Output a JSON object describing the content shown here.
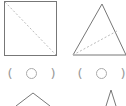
{
  "worksheet": {
    "figures": [
      {
        "shape": "square",
        "fold_line": "diagonal",
        "answer": {
          "open": "(",
          "mark": "circle",
          "close": ")"
        }
      },
      {
        "shape": "triangle",
        "fold_line": "vertex-to-side",
        "answer": {
          "open": "(",
          "mark": "circle",
          "close": ")"
        }
      },
      {
        "shape": "roof-caret",
        "partial": true
      },
      {
        "shape": "narrow-peak",
        "partial": true
      }
    ],
    "colors": {
      "outline": "#777777",
      "dashed": "#bbbbbb",
      "mark": "#aaaaaa"
    }
  }
}
